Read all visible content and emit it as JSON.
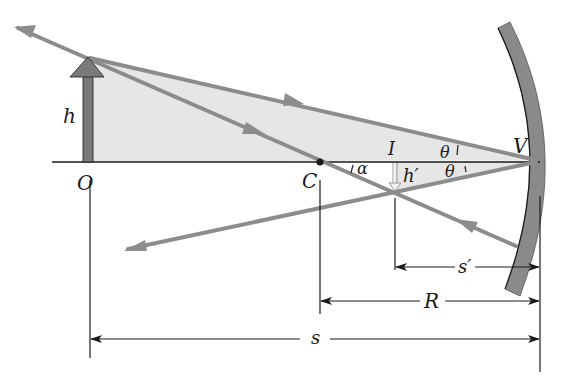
{
  "figure": {
    "type": "concave-mirror-ray-diagram",
    "labels": {
      "object_height": "h",
      "image_height": "h′",
      "object_point": "O",
      "center_of_curvature": "C",
      "image_point": "I",
      "vertex": "V",
      "angle_alpha": "α",
      "angle_theta_upper": "θ",
      "angle_theta_lower": "θ",
      "image_distance": "s′",
      "radius": "R",
      "object_distance": "s"
    },
    "colors": {
      "ray": "#8c8c8c",
      "mirror": "#8a8a8a",
      "object_arrow": "#7a7a7a",
      "shaded_triangle": "#e6e6e6",
      "axis": "#1a1a1a",
      "ink": "#1a1a1a"
    }
  }
}
